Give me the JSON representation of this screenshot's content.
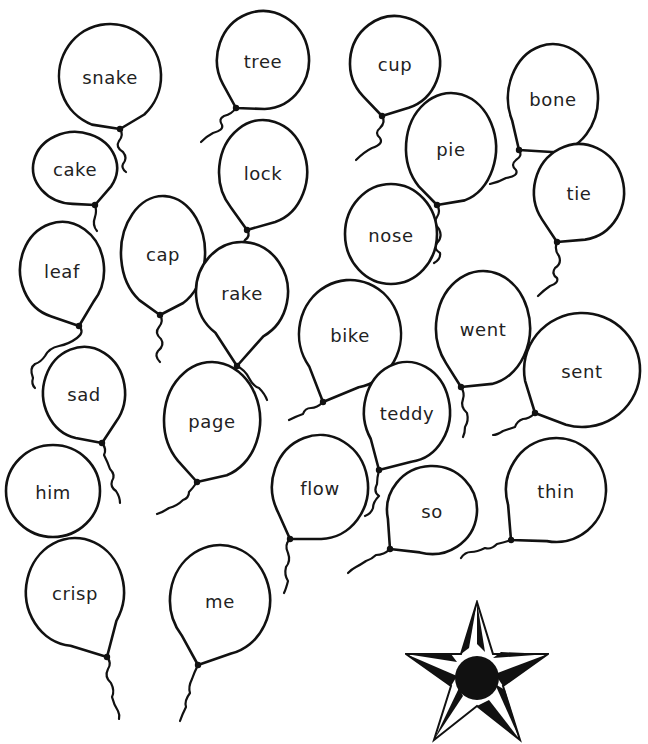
{
  "worksheet": {
    "balloons": [
      {
        "word": "snake",
        "cx": 110,
        "cy": 76,
        "rx": 51,
        "ry": 52,
        "knot": [
          120,
          129
        ],
        "string": "M120 129 q4 6 -1 12 q-4 6 4 11 q5 6 0 12 q-2 4 3 8"
      },
      {
        "word": "tree",
        "cx": 263,
        "cy": 60,
        "rx": 46,
        "ry": 49,
        "knot": [
          236,
          108
        ],
        "string": "M236 108 q-4 6 -12 8 q-6 3 -2 9 q2 5 -9 8 q-6 3 -12 9"
      },
      {
        "word": "cup",
        "cx": 395,
        "cy": 63,
        "rx": 45,
        "ry": 47,
        "knot": [
          382,
          116
        ],
        "string": "M382 116 q4 6 -2 12 q-6 5 0 10 q4 6 -8 10 q-8 4 -16 12"
      },
      {
        "word": "bone",
        "cx": 553,
        "cy": 98,
        "rx": 45,
        "ry": 54,
        "knot": [
          519,
          150
        ],
        "string": "M519 150 q4 6 -3 10 q-6 5 0 10 q3 6 -10 8 q-7 4 -16 6"
      },
      {
        "word": "cake",
        "cx": 75,
        "cy": 168,
        "rx": 42,
        "ry": 36,
        "knot": [
          95,
          205
        ],
        "string": "M95 205 q2 6 0 12 q-3 8 2 14"
      },
      {
        "word": "lock",
        "cx": 263,
        "cy": 172,
        "rx": 44,
        "ry": 52,
        "knot": [
          247,
          230
        ],
        "string": "M247 230 q4 6 -2 10 q-4 5 3 10"
      },
      {
        "word": "pie",
        "cx": 451,
        "cy": 148,
        "rx": 45,
        "ry": 55,
        "knot": [
          437,
          205
        ],
        "string": "M437 205 q4 6 0 12 q-4 6 2 12 q4 8 -2 14 q-4 6 3 10 q1 6 -6 10"
      },
      {
        "word": "tie",
        "cx": 579,
        "cy": 192,
        "rx": 45,
        "ry": 48,
        "knot": [
          557,
          242
        ],
        "string": "M557 242 q-3 8 2 14 q3 8 -4 12 q-4 6 2 10 q2 5 -7 8 q-6 4 -12 10"
      },
      {
        "word": "cap",
        "cx": 163,
        "cy": 253,
        "rx": 42,
        "ry": 57,
        "knot": [
          160,
          315
        ],
        "string": "M160 315 q4 6 -1 12 q-5 6 2 12 q4 6 -3 12 q-4 5 2 11"
      },
      {
        "word": "nose",
        "cx": 391,
        "cy": 234,
        "rx": 46,
        "ry": 50,
        "knot": [
          0,
          0
        ],
        "string": ""
      },
      {
        "word": "leaf",
        "cx": 62,
        "cy": 270,
        "rx": 42,
        "ry": 48,
        "knot": [
          79,
          326
        ],
        "string": "M79 326 q6 6 -2 12 q-8 6 -18 8 q-10 2 -14 10 q-4 6 -10 8 q-6 4 -2 14 q-2 6 2 10"
      },
      {
        "word": "rake",
        "cx": 242,
        "cy": 292,
        "rx": 46,
        "ry": 50,
        "knot": [
          237,
          366
        ],
        "string": "M237 366 q8 4 12 12 q4 8 10 10 q6 6 8 12"
      },
      {
        "word": "bike",
        "cx": 350,
        "cy": 334,
        "rx": 51,
        "ry": 54,
        "knot": [
          323,
          402
        ],
        "string": "M323 402 q-6 6 -12 6 q-6 0 -8 6 q-6 2 -14 6"
      },
      {
        "word": "went",
        "cx": 483,
        "cy": 328,
        "rx": 47,
        "ry": 57,
        "knot": [
          461,
          387
        ],
        "string": "M461 387 q4 6 2 12 q-3 8 4 14 q2 8 -2 14 q0 6 -2 10"
      },
      {
        "word": "sent",
        "cx": 582,
        "cy": 370,
        "rx": 58,
        "ry": 57,
        "knot": [
          535,
          413
        ],
        "string": "M535 413 q-6 6 -12 6 q-6 2 -8 8 q-6 2 -12 4 q-6 4 -10 4"
      },
      {
        "word": "sad",
        "cx": 84,
        "cy": 393,
        "rx": 41,
        "ry": 46,
        "knot": [
          102,
          443
        ],
        "string": "M102 443 q5 6 2 12 q4 8 6 14 q6 6 2 12 q-2 6 4 10 q4 6 4 12"
      },
      {
        "word": "page",
        "cx": 212,
        "cy": 420,
        "rx": 48,
        "ry": 58,
        "knot": [
          197,
          482
        ],
        "string": "M197 482 q-4 6 -8 10 q0 6 -6 8 q-6 6 -14 8 q-6 4 -12 6"
      },
      {
        "word": "teddy",
        "cx": 407,
        "cy": 412,
        "rx": 43,
        "ry": 50,
        "knot": [
          379,
          470
        ],
        "string": "M379 470 q-2 8 -2 14 q-4 8 2 12 q-6 6 -6 12 q-2 6 -8 8"
      },
      {
        "word": "flow",
        "cx": 320,
        "cy": 487,
        "rx": 48,
        "ry": 52,
        "knot": [
          290,
          539
        ],
        "string": "M290 539 q-6 6 -2 14 q3 8 -2 14 q-2 8 2 14 q-2 8 -4 12"
      },
      {
        "word": "so",
        "cx": 432,
        "cy": 510,
        "rx": 45,
        "ry": 44,
        "knot": [
          390,
          549
        ],
        "string": "M390 549 q-6 6 -14 6 q-4 4 -10 6 q-6 4 -10 6 q-4 2 -8 6"
      },
      {
        "word": "thin",
        "cx": 556,
        "cy": 490,
        "rx": 50,
        "ry": 52,
        "knot": [
          511,
          540
        ],
        "string": "M511 540 q-6 2 -14 4 q-6 6 -12 4 q-8 4 -14 4 q-6 0 -10 6"
      },
      {
        "word": "him",
        "cx": 53,
        "cy": 491,
        "rx": 47,
        "ry": 46,
        "knot": [
          0,
          0
        ],
        "string": ""
      },
      {
        "word": "crisp",
        "cx": 75,
        "cy": 592,
        "rx": 49,
        "ry": 54,
        "knot": [
          107,
          657
        ],
        "string": "M107 657 q5 6 1 12 q-4 8 3 14 q4 8 1 14 q2 8 6 14 q2 4 1 8"
      },
      {
        "word": "me",
        "cx": 220,
        "cy": 600,
        "rx": 50,
        "ry": 55,
        "knot": [
          198,
          665
        ],
        "string": "M198 665 q-4 8 -6 14 q-4 8 -2 14 q-6 8 -4 14 q-4 8 -6 14"
      }
    ],
    "reward_star": {
      "label": "star-reward",
      "fill": "#111111"
    },
    "colors": {
      "ink": "#111111",
      "text": "#222222",
      "paper": "#ffffff"
    }
  }
}
